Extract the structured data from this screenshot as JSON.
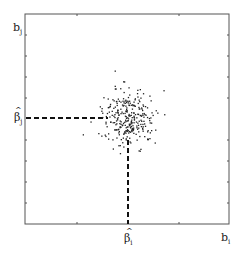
{
  "diagram": {
    "type": "scatter",
    "y_axis_label": "b",
    "y_axis_sub": "j",
    "x_axis_label": "b",
    "x_axis_sub": "i",
    "y_marker_label": "β",
    "y_marker_sub": "j",
    "x_marker_label": "β",
    "x_marker_sub": "i",
    "hat": "^"
  },
  "chart_data": {
    "type": "scatter",
    "title": "",
    "xlabel": "b_i",
    "ylabel": "b_j",
    "x_marker": "β̂_i",
    "y_marker": "β̂_j",
    "center": [
      128,
      118
    ],
    "grid": false,
    "annotations": [
      "dashed line from y-axis to estimate β̂_j",
      "dashed line from x-axis to estimate β̂_i"
    ]
  }
}
